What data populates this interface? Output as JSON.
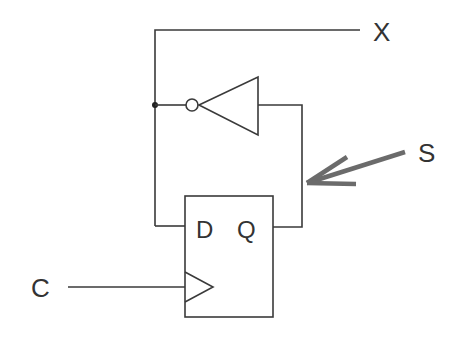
{
  "diagram": {
    "type": "circuit-schematic",
    "labels": {
      "output": "X",
      "signal": "S",
      "clock": "C",
      "d_input": "D",
      "q_output": "Q"
    },
    "components": [
      {
        "name": "D flip-flop",
        "pins": [
          "D",
          "Q",
          "clock"
        ]
      },
      {
        "name": "inverter (NOT gate)"
      }
    ],
    "colors": {
      "wire": "#3a3a3a",
      "arrow": "#6b6b6b",
      "background": "#ffffff"
    }
  }
}
